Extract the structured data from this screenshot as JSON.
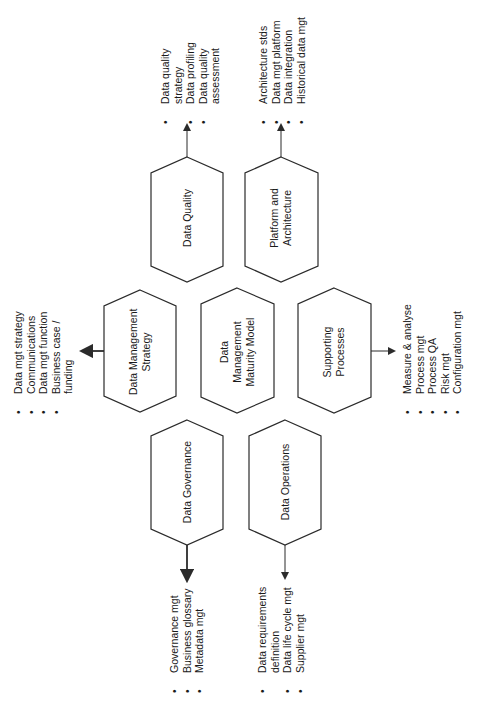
{
  "diagram": {
    "center": {
      "label_lines": [
        "Data",
        "Management",
        "Maturity Model"
      ]
    },
    "nodes": [
      {
        "id": "data-quality",
        "label_lines": [
          "Data Quality"
        ],
        "items": [
          [
            "Data quality",
            "strategy"
          ],
          [
            "Data profiling"
          ],
          [
            "Data quality",
            "assessment"
          ]
        ]
      },
      {
        "id": "platform-architecture",
        "label_lines": [
          "Platform and",
          "Architecture"
        ],
        "items": [
          [
            "Architecture stds"
          ],
          [
            "Data mgt platform"
          ],
          [
            "Data integration"
          ],
          [
            "Historical data mgt"
          ]
        ]
      },
      {
        "id": "data-management-strategy",
        "label_lines": [
          "Data Management",
          "Strategy"
        ],
        "items": [
          [
            "Data mgt strategy"
          ],
          [
            "Communications"
          ],
          [
            "Data mgt function"
          ],
          [
            "Business case /",
            "funding"
          ]
        ]
      },
      {
        "id": "supporting-processes",
        "label_lines": [
          "Supporting",
          "Processes"
        ],
        "items": [
          [
            "Measure & analyse"
          ],
          [
            "Process mgt"
          ],
          [
            "Process QA"
          ],
          [
            "Risk mgt"
          ],
          [
            "Configuration mgt"
          ]
        ]
      },
      {
        "id": "data-governance",
        "label_lines": [
          "Data Governance"
        ],
        "items": [
          [
            "Governance mgt"
          ],
          [
            "Business glossary"
          ],
          [
            "Metadata mgt"
          ]
        ]
      },
      {
        "id": "data-operations",
        "label_lines": [
          "Data Operations"
        ],
        "items": [
          [
            "Data requirements",
            "definition"
          ],
          [
            "Data life cycle mgt"
          ],
          [
            "Supplier mgt"
          ]
        ]
      }
    ]
  },
  "text": {
    "dq_label": "Data Quality",
    "pa_label_1": "Platform and",
    "pa_label_2": "Architecture",
    "dms_label_1": "Data Management",
    "dms_label_2": "Strategy",
    "center_label_1": "Data",
    "center_label_2": "Management",
    "center_label_3": "Maturity Model",
    "sp_label_1": "Supporting",
    "sp_label_2": "Processes",
    "dg_label": "Data Governance",
    "do_label": "Data Operations",
    "dq_items": [
      "Data quality",
      "strategy",
      "Data profiling",
      "Data quality",
      "assessment"
    ],
    "pa_items": [
      "Architecture stds",
      "Data mgt platform",
      "Data integration",
      "Historical data mgt"
    ],
    "dms_items": [
      "Data mgt strategy",
      "Communications",
      "Data mgt function",
      "Business case /",
      "funding"
    ],
    "sp_items": [
      "Measure & analyse",
      "Process mgt",
      "Process QA",
      "Risk mgt",
      "Configuration mgt"
    ],
    "dg_items": [
      "Governance mgt",
      "Business glossary",
      "Metadata mgt"
    ],
    "do_items": [
      "Data requirements",
      "definition",
      "Data life cycle mgt",
      "Supplier mgt"
    ]
  },
  "colors": {
    "stroke": "#2b2b2b",
    "text": "#1a1a1a",
    "background": "#ffffff"
  }
}
